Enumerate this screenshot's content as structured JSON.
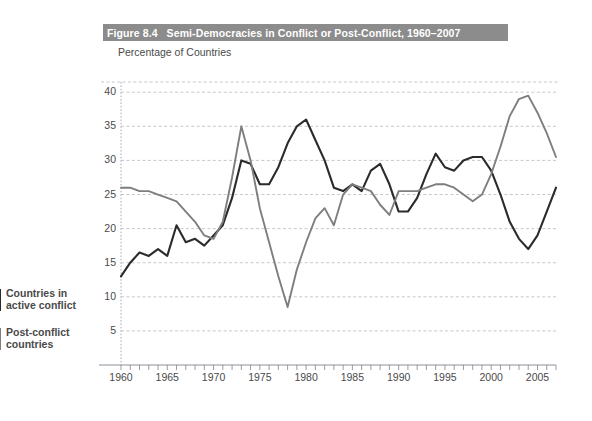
{
  "figure": {
    "number": "Figure 8.4",
    "title": "Semi-Democracies in Conflict or Post-Conflict, 1960–2007",
    "title_bar_color": "#8c8c8c",
    "title_text_color": "#ffffff"
  },
  "legend": {
    "position": "left-margin",
    "entries": [
      {
        "label": "Countries in\nactive conflict",
        "color": "#2b2b2b"
      },
      {
        "label": "Post-conflict\ncountries",
        "color": "#7e7e7e"
      }
    ]
  },
  "chart_data": {
    "type": "line",
    "title": "Semi-Democracies in Conflict or Post-Conflict, 1960–2007",
    "subtitle": "Percentage of Countries",
    "xlabel": "",
    "ylabel": "Percentage of Countries",
    "xlim": [
      1960,
      2007
    ],
    "ylim": [
      0,
      41.5
    ],
    "grid": true,
    "y_ticks": [
      5,
      10,
      15,
      20,
      25,
      30,
      35,
      40
    ],
    "x_ticks": [
      1960,
      1965,
      1970,
      1975,
      1980,
      1985,
      1990,
      1995,
      2000,
      2005
    ],
    "x_tick_labels": [
      "1960",
      "1965",
      "1970",
      "1975",
      "1980",
      "1985",
      "1990",
      "1995",
      "2000",
      "2005"
    ],
    "y_tick_labels": [
      "5",
      "10",
      "15",
      "20",
      "25",
      "30",
      "35",
      "40"
    ],
    "x_minor_tick_interval": 1,
    "x": [
      1960,
      1961,
      1962,
      1963,
      1964,
      1965,
      1966,
      1967,
      1968,
      1969,
      1970,
      1971,
      1972,
      1973,
      1974,
      1975,
      1976,
      1977,
      1978,
      1979,
      1980,
      1981,
      1982,
      1983,
      1984,
      1985,
      1986,
      1987,
      1988,
      1989,
      1990,
      1991,
      1992,
      1993,
      1994,
      1995,
      1996,
      1997,
      1998,
      1999,
      2000,
      2001,
      2002,
      2003,
      2004,
      2005,
      2006,
      2007
    ],
    "series": [
      {
        "name": "Countries in active conflict",
        "color": "#2b2b2b",
        "values": [
          13.0,
          15.0,
          16.5,
          16.0,
          17.0,
          16.0,
          20.5,
          18.0,
          18.5,
          17.5,
          19.0,
          20.5,
          24.5,
          30.0,
          29.5,
          26.5,
          26.5,
          29.0,
          32.5,
          35.0,
          36.0,
          33.0,
          30.0,
          26.0,
          25.5,
          26.5,
          25.5,
          28.5,
          29.5,
          26.5,
          22.5,
          22.5,
          24.5,
          28.0,
          31.0,
          29.0,
          28.5,
          30.0,
          30.5,
          30.5,
          28.5,
          25.0,
          21.0,
          18.5,
          17.0,
          19.0,
          22.5,
          26.0
        ]
      },
      {
        "name": "Post-conflict countries",
        "color": "#7e7e7e",
        "values": [
          26.0,
          26.0,
          25.5,
          25.5,
          25.0,
          24.5,
          24.0,
          22.5,
          21.0,
          19.0,
          18.5,
          21.0,
          27.5,
          35.0,
          30.0,
          23.0,
          18.0,
          13.0,
          8.5,
          14.0,
          18.0,
          21.5,
          23.0,
          20.5,
          25.0,
          26.5,
          26.0,
          25.5,
          23.5,
          22.0,
          25.5,
          25.5,
          25.5,
          26.0,
          26.5,
          26.5,
          26.0,
          25.0,
          24.0,
          25.0,
          28.0,
          32.0,
          36.5,
          39.0,
          39.5,
          37.0,
          34.0,
          30.5
        ]
      }
    ]
  }
}
